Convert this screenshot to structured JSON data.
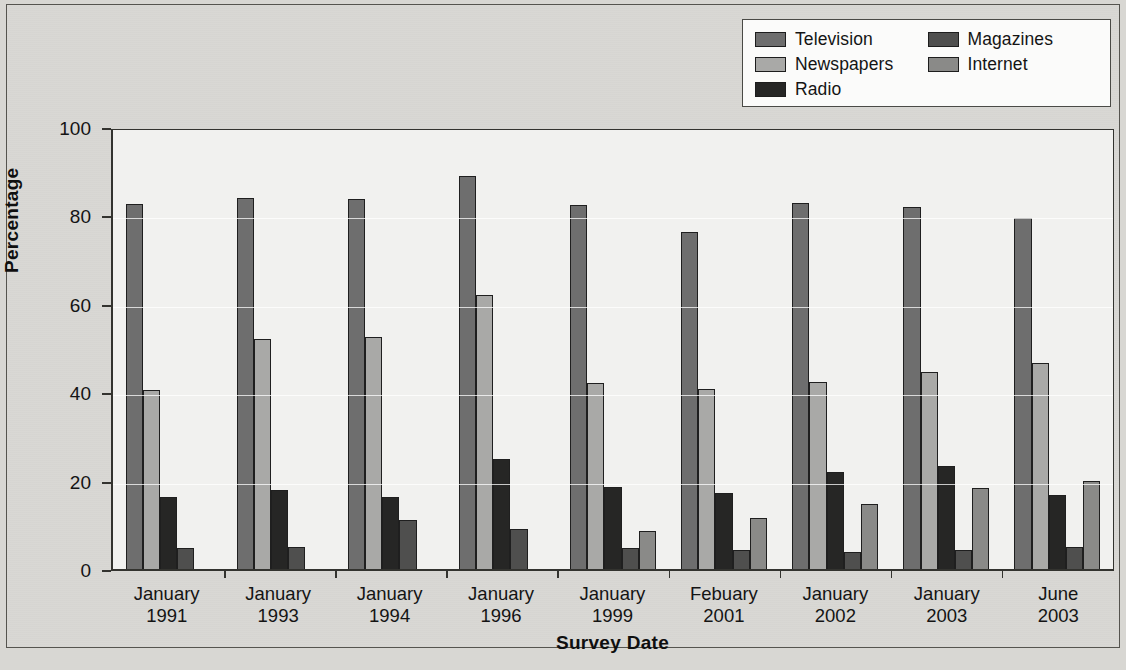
{
  "chart_data": {
    "type": "bar",
    "title": "",
    "xlabel": "Survey Date",
    "ylabel": "Percentage",
    "ylim": [
      0,
      100
    ],
    "yticks": [
      0,
      20,
      40,
      60,
      80,
      100
    ],
    "grid": true,
    "legend_position": "top-right",
    "categories": [
      "January 1991",
      "January 1993",
      "January 1994",
      "January 1996",
      "January 1999",
      "Febuary 2001",
      "January 2002",
      "January 2003",
      "June 2003"
    ],
    "category_lines": [
      {
        "l1": "January",
        "l2": "1991"
      },
      {
        "l1": "January",
        "l2": "1993"
      },
      {
        "l1": "January",
        "l2": "1994"
      },
      {
        "l1": "January",
        "l2": "1996"
      },
      {
        "l1": "January",
        "l2": "1999"
      },
      {
        "l1": "Febuary",
        "l2": "2001"
      },
      {
        "l1": "January",
        "l2": "2002"
      },
      {
        "l1": "January",
        "l2": "2003"
      },
      {
        "l1": "June",
        "l2": "2003"
      }
    ],
    "series": [
      {
        "name": "Television",
        "color": "#6e6e6e",
        "values": [
          82.5,
          84.0,
          83.8,
          89.0,
          82.3,
          76.3,
          82.8,
          82.0,
          79.5
        ]
      },
      {
        "name": "Newspapers",
        "color": "#a9a9a7",
        "values": [
          40.5,
          52.0,
          52.5,
          62.0,
          42.0,
          40.7,
          42.2,
          44.5,
          46.5
        ]
      },
      {
        "name": "Radio",
        "color": "#262625",
        "values": [
          16.3,
          17.8,
          16.2,
          25.0,
          18.6,
          17.2,
          21.9,
          23.2,
          16.8
        ]
      },
      {
        "name": "Magazines",
        "color": "#4f4f4e",
        "values": [
          4.7,
          5.0,
          11.0,
          9.0,
          4.8,
          4.4,
          3.8,
          4.4,
          5.0
        ]
      },
      {
        "name": "Internet",
        "color": "#8a8a88",
        "values": [
          null,
          null,
          null,
          null,
          8.6,
          11.5,
          14.8,
          18.4,
          20.0
        ]
      }
    ]
  },
  "legend": {
    "columns": [
      [
        {
          "label": "Television",
          "color": "#6e6e6e"
        },
        {
          "label": "Newspapers",
          "color": "#a9a9a7"
        },
        {
          "label": "Radio",
          "color": "#262625"
        }
      ],
      [
        {
          "label": "Magazines",
          "color": "#4f4f4e"
        },
        {
          "label": "Internet",
          "color": "#8a8a88"
        }
      ]
    ]
  },
  "axes": {
    "y_title": "Percentage",
    "x_title": "Survey Date",
    "y_tick_labels": [
      "100",
      "80",
      "60",
      "40",
      "20",
      "0"
    ]
  },
  "caption": ""
}
